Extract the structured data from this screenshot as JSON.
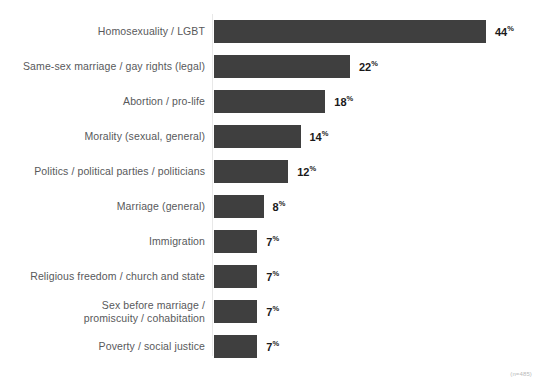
{
  "footnote": "(n=485)",
  "chart_data": {
    "type": "bar",
    "orientation": "horizontal",
    "title": "",
    "subtitle": "",
    "xlabel": "",
    "ylabel": "",
    "xlim": [
      0,
      44
    ],
    "grid": false,
    "legend": null,
    "value_suffix": "%",
    "bar_color": "#3f3f3f",
    "label_color": "#58595b",
    "categories": [
      "Homosexuality / LGBT",
      "Same-sex marriage / gay rights (legal)",
      "Abortion / pro-life",
      "Morality (sexual, general)",
      "Politics / political parties / politicians",
      "Marriage (general)",
      "Immigration",
      "Religious freedom / church and state",
      "Sex before marriage /\npromiscuity / cohabitation",
      "Poverty / social justice"
    ],
    "values": [
      44,
      22,
      18,
      14,
      12,
      8,
      7,
      7,
      7,
      7
    ],
    "value_labels": [
      "44",
      "22",
      "18",
      "14",
      "12",
      "8",
      "7",
      "7",
      "7",
      "7"
    ],
    "annotations": [
      "(n=485)"
    ]
  }
}
